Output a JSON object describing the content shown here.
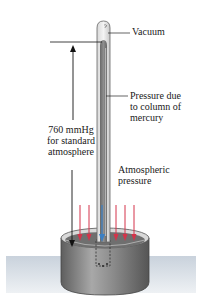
{
  "diagram": {
    "labels": {
      "vacuum": "Vacuum",
      "column_line1": "Pressure due",
      "column_line2": "to column of",
      "column_line3": "mercury",
      "height_line1": "760 mmHg",
      "height_line2": "for standard",
      "height_line3": "atmosphere",
      "atm_line1": "Atmospheric",
      "atm_line2": "pressure"
    },
    "colors": {
      "atmospheric_arrow": "#d4334a",
      "mercury_arrow": "#3a7fc4",
      "height_arrow": "#111111",
      "mercury": "#7a7a7a",
      "dish": "#8c8c8c",
      "table": "#dde3ea"
    },
    "atmospheric_arrow_count": 6,
    "mercury_arrow_count": 1
  }
}
